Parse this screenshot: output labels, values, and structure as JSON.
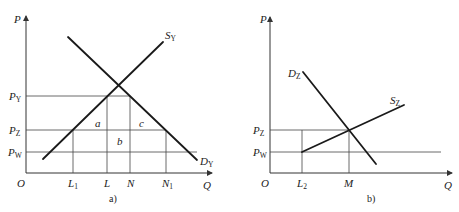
{
  "panel_a": {
    "caption": "a)",
    "axis": {
      "y_label": "P",
      "x_label": "Q",
      "origin": "O"
    },
    "price_levels": [
      {
        "label": "P",
        "sub": "Y"
      },
      {
        "label": "P",
        "sub": "Z"
      },
      {
        "label": "P",
        "sub": "W"
      }
    ],
    "quantities": [
      {
        "label": "L",
        "sub": "1"
      },
      {
        "label": "L",
        "sub": ""
      },
      {
        "label": "N",
        "sub": ""
      },
      {
        "label": "N",
        "sub": "1"
      }
    ],
    "curves": {
      "supply": {
        "label": "S",
        "sub": "Y"
      },
      "demand": {
        "label": "D",
        "sub": "Y"
      }
    },
    "areas": {
      "a": "a",
      "b": "b",
      "c": "c"
    }
  },
  "panel_b": {
    "caption": "b)",
    "axis": {
      "y_label": "P",
      "x_label": "Q",
      "origin": "O"
    },
    "price_levels": [
      {
        "label": "P",
        "sub": "Z"
      },
      {
        "label": "P",
        "sub": "W"
      }
    ],
    "quantities": [
      {
        "label": "L",
        "sub": "2"
      },
      {
        "label": "M",
        "sub": ""
      }
    ],
    "curves": {
      "supply": {
        "label": "S",
        "sub": "Z"
      },
      "demand": {
        "label": "D",
        "sub": "Z"
      }
    }
  }
}
